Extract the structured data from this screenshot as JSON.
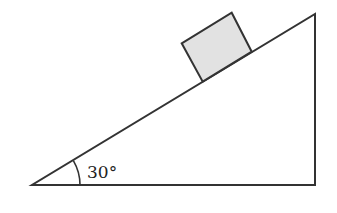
{
  "diagram": {
    "type": "inclined-plane",
    "angle_label": "30°",
    "angle_degrees": 30,
    "elements": [
      "incline-triangle",
      "block-on-incline",
      "angle-arc"
    ],
    "colors": {
      "stroke": "#333333",
      "block_fill": "#e2e2e2",
      "background": "#ffffff"
    }
  }
}
